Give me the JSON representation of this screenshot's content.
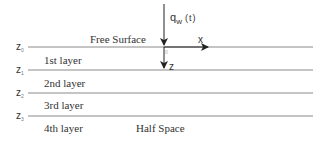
{
  "diagram": {
    "type": "layered half-space with surface load",
    "colors": {
      "lines": "#8a8a8a",
      "arrows": "#222222",
      "text": "#333333"
    },
    "load": {
      "symbol": "q",
      "subscript": "w",
      "argument": "(t)"
    },
    "axes": {
      "x_label": "x",
      "z_label": "z",
      "origin_label": "0"
    },
    "surface_label": "Free Surface",
    "interfaces": [
      {
        "symbol": "z",
        "index": "0"
      },
      {
        "symbol": "z",
        "index": "1"
      },
      {
        "symbol": "z",
        "index": "2"
      },
      {
        "symbol": "z",
        "index": "3"
      }
    ],
    "layers": [
      {
        "label": "1st layer"
      },
      {
        "label": "2nd layer"
      },
      {
        "label": "3rd layer"
      },
      {
        "label": "4th layer"
      }
    ],
    "half_space_label": "Half Space"
  }
}
